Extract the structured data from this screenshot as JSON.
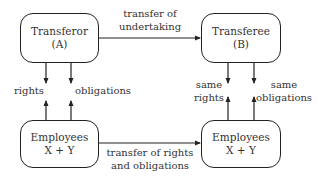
{
  "diagram": {
    "nodes": {
      "transferor": {
        "line1": "Transferor",
        "line2": "(A)"
      },
      "transferee": {
        "line1": "Transferee",
        "line2": "(B)"
      },
      "employees_left": {
        "line1": "Employees",
        "line2": "X + Y"
      },
      "employees_right": {
        "line1": "Employees",
        "line2": "X + Y"
      }
    },
    "edges": {
      "top": {
        "line1": "transfer of",
        "line2": "undertaking"
      },
      "bottom": {
        "line1": "transfer of rights",
        "line2": "and obligations"
      },
      "left_rights": "rights",
      "left_obligations": "obligations",
      "right_rights_line1": "same",
      "right_rights_line2": "rights",
      "right_obligations_line1": "same",
      "right_obligations_line2": "obligations"
    },
    "colors": {
      "stroke": "#222222",
      "text": "#333333",
      "background": "#ffffff"
    }
  }
}
